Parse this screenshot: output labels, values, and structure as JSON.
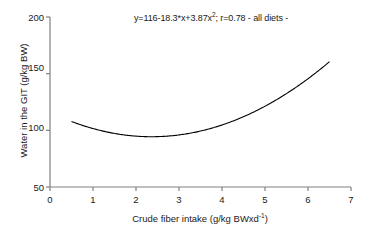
{
  "chart_data": {
    "type": "line",
    "title": "",
    "annotation": "y=116-18.3*x+3.87x²; r=0.78 - all diets -",
    "annotation_parts": {
      "before_sup": "y=116-18.3*x+3.87x",
      "sup": "2",
      "after_sup": "; r=0.78 - all diets -"
    },
    "equation": "y=116-18.3*x+3.87x^2",
    "coefficients": {
      "intercept": 116,
      "linear": -18.3,
      "quadratic": 3.87
    },
    "r": 0.78,
    "group": "all diets",
    "xlabel_parts": {
      "before_sup": "Crude fiber intake (g/kg BWxd",
      "sup": "-1",
      "after_sup": ")"
    },
    "xlabel": "Crude fiber intake (g/kg BWxd-1)",
    "ylabel": "Water in the GIT (g/kg BW)",
    "xlim": [
      0,
      7
    ],
    "ylim": [
      50,
      200
    ],
    "xticks": [
      "0",
      "1",
      "2",
      "3",
      "4",
      "5",
      "6",
      "7"
    ],
    "yticks": [
      "200",
      "150",
      "100",
      "50"
    ],
    "grid": false,
    "legend": "none",
    "x_domain_plotted": [
      0.5,
      6.5
    ],
    "series": [
      {
        "name": "all diets",
        "x": [
          0.5,
          1.0,
          1.5,
          2.0,
          2.5,
          3.0,
          3.5,
          4.0,
          4.5,
          5.0,
          5.5,
          6.0,
          6.5
        ],
        "values": [
          107.8,
          101.6,
          97.4,
          95.0,
          94.5,
          94.8,
          99.2,
          104.9,
          112.2,
          121.2,
          131.9,
          144.3,
          158.4
        ]
      }
    ],
    "vertex": {
      "x": 2.36,
      "y": 94.4
    },
    "line_color": "#000000",
    "axis_color": "#808080"
  }
}
